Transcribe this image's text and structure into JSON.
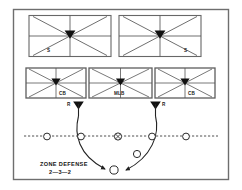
{
  "figure": {
    "title": "ZONE DEFENSE",
    "subtitle": "2—3—2",
    "border_color": "#6e6e6e",
    "line_color": "#4a4a4a",
    "marker_color": "#111111",
    "background": "#ffffff"
  },
  "deep_zones": [
    {
      "id": "deep-left",
      "label": "S",
      "role": "safety",
      "x": 47,
      "y": 42
    },
    {
      "id": "deep-right",
      "label": "S",
      "role": "safety",
      "x": 186,
      "y": 42
    }
  ],
  "underneath_zones": [
    {
      "id": "zone-left-cb",
      "label": "CB",
      "role": "cornerback",
      "x": 35,
      "y": 70
    },
    {
      "id": "zone-middle-mlb",
      "label": "MLB",
      "role": "middle-linebacker",
      "x": 87,
      "y": 70
    },
    {
      "id": "zone-right-cb",
      "label": "CB",
      "role": "cornerback",
      "x": 154,
      "y": 70
    }
  ],
  "rushers": [
    {
      "id": "rusher-left",
      "label": "R",
      "role": "rusher",
      "x": 73,
      "y": 104
    },
    {
      "id": "rusher-right",
      "label": "R",
      "role": "rusher",
      "x": 162,
      "y": 104
    }
  ],
  "offense": {
    "line_of_scrimmage_label": "line-of-scrimmage",
    "linemen": [
      {
        "id": "lineman-1",
        "x": 47,
        "y": 136,
        "has_ball": false
      },
      {
        "id": "lineman-2",
        "x": 81,
        "y": 136,
        "has_ball": false
      },
      {
        "id": "center",
        "x": 118,
        "y": 136,
        "has_ball": true
      },
      {
        "id": "lineman-4",
        "x": 152,
        "y": 136,
        "has_ball": false
      },
      {
        "id": "lineman-5",
        "x": 186,
        "y": 136,
        "has_ball": false
      }
    ],
    "backfield": [
      {
        "id": "back",
        "x": 137,
        "y": 154,
        "role": "back"
      },
      {
        "id": "quarterback",
        "x": 113,
        "y": 170,
        "role": "quarterback"
      }
    ]
  },
  "rush_paths": [
    {
      "id": "rush-path-left",
      "from": "rusher-left",
      "to": "quarterback"
    },
    {
      "id": "rush-path-right",
      "from": "rusher-right",
      "to": "quarterback"
    }
  ],
  "icons": {
    "zone_marker": "triangle-marker-icon",
    "player_marker": "circle-player-icon",
    "ball_marker": "ball-icon",
    "arrow": "curved-arrow-icon"
  }
}
